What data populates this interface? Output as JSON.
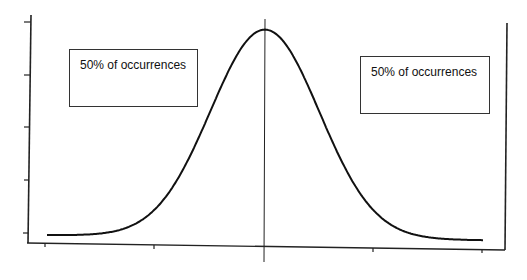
{
  "chart_data": {
    "type": "line",
    "title": "",
    "xlabel": "",
    "ylabel": "",
    "distribution": "normal",
    "mean": 0,
    "std": 1,
    "x_range": [
      -4,
      4
    ],
    "x_ticks": [
      -4,
      -2,
      0,
      2,
      4
    ],
    "y_ticks_count": 5,
    "tick_labels_shown": false,
    "grid": false,
    "legend": null,
    "series": [
      {
        "name": "normal density",
        "x": [
          -4,
          -3.5,
          -3,
          -2.5,
          -2,
          -1.5,
          -1,
          -0.5,
          0,
          0.5,
          1,
          1.5,
          2,
          2.5,
          3,
          3.5,
          4
        ],
        "y": [
          0.0001,
          0.0009,
          0.0044,
          0.0175,
          0.054,
          0.1295,
          0.242,
          0.3521,
          0.3989,
          0.3521,
          0.242,
          0.1295,
          0.054,
          0.0175,
          0.0044,
          0.0009,
          0.0001
        ]
      }
    ],
    "annotations": [
      {
        "text": "50% of occurrences",
        "position": "left half"
      },
      {
        "text": "50% of occurrences",
        "position": "right half"
      }
    ],
    "reference_lines": [
      {
        "orientation": "vertical",
        "x": 0,
        "label": "mean"
      }
    ]
  },
  "annotations": {
    "left": "50% of occurrences",
    "right": "50% of occurrences"
  },
  "style": {
    "line_color": "#111111",
    "axis_color": "#222222",
    "box_border": "#333333"
  }
}
